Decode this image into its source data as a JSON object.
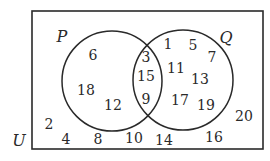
{
  "diagram": {
    "type": "venn",
    "universe": {
      "label": "U",
      "label_pos": [
        19,
        146
      ],
      "rect": {
        "x": 32,
        "y": 11,
        "width": 231,
        "height": 138
      }
    },
    "sets": [
      {
        "label": "P",
        "center": [
          112,
          81
        ],
        "radius": 50,
        "label_pos": [
          62,
          42
        ]
      },
      {
        "label": "Q",
        "center": [
          183,
          80
        ],
        "radius": 50,
        "label_pos": [
          226,
          43
        ]
      }
    ],
    "regions": {
      "P_only": [
        {
          "value": "6",
          "pos": [
            93,
            60
          ]
        },
        {
          "value": "18",
          "pos": [
            86,
            95
          ]
        },
        {
          "value": "12",
          "pos": [
            113,
            110
          ]
        }
      ],
      "P_and_Q": [
        {
          "value": "3",
          "pos": [
            146,
            62
          ]
        },
        {
          "value": "15",
          "pos": [
            146,
            81
          ]
        },
        {
          "value": "9",
          "pos": [
            146,
            104
          ]
        }
      ],
      "Q_only": [
        {
          "value": "1",
          "pos": [
            168,
            49
          ]
        },
        {
          "value": "5",
          "pos": [
            193,
            50
          ]
        },
        {
          "value": "7",
          "pos": [
            212,
            62
          ]
        },
        {
          "value": "11",
          "pos": [
            176,
            73
          ]
        },
        {
          "value": "13",
          "pos": [
            200,
            84
          ]
        },
        {
          "value": "17",
          "pos": [
            180,
            105
          ]
        },
        {
          "value": "19",
          "pos": [
            206,
            110
          ]
        }
      ],
      "neither": [
        {
          "value": "2",
          "pos": [
            49,
            129
          ]
        },
        {
          "value": "4",
          "pos": [
            66,
            144
          ]
        },
        {
          "value": "8",
          "pos": [
            98,
            144
          ]
        },
        {
          "value": "10",
          "pos": [
            134,
            143
          ]
        },
        {
          "value": "14",
          "pos": [
            164,
            145
          ]
        },
        {
          "value": "16",
          "pos": [
            214,
            142
          ]
        },
        {
          "value": "20",
          "pos": [
            244,
            121
          ]
        }
      ]
    },
    "stroke_color": "#2a2a2a",
    "background": "#ffffff"
  }
}
